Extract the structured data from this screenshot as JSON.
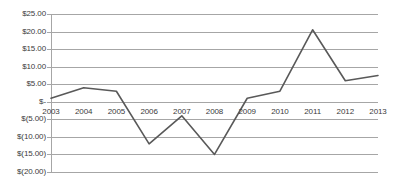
{
  "chart_data": {
    "type": "line",
    "title": "",
    "subtitle": "",
    "xlabel": "",
    "ylabel": "",
    "categories": [
      "2003",
      "2004",
      "2005",
      "2006",
      "2007",
      "2008",
      "2009",
      "2010",
      "2011",
      "2012",
      "2013"
    ],
    "series": [
      {
        "name": "",
        "values": [
          1.0,
          4.0,
          3.0,
          -12.0,
          -4.0,
          -15.0,
          1.0,
          3.0,
          20.5,
          6.0,
          7.5
        ]
      }
    ],
    "ylim": [
      -20,
      25
    ],
    "ytick_values": [
      25,
      20,
      15,
      10,
      5,
      0,
      -5,
      -10,
      -15,
      -20
    ],
    "ytick_labels": [
      "$25.00",
      "$20.00",
      "$15.00",
      "$10.00",
      "$5.00",
      "$-",
      "$(5.00)",
      "$(10.00)",
      "$(15.00)",
      "$(20.00)"
    ],
    "grid": true,
    "grid_axis": "y",
    "legend": false,
    "legend_position": "none",
    "line_color": "#595959",
    "grid_color": "#a6a6a6",
    "axis_color": "#a6a6a6",
    "text_color": "#3b3b3b",
    "background_color": "#ffffff",
    "markers": false
  }
}
